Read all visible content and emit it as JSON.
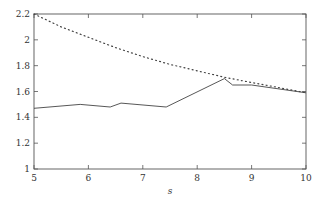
{
  "chart_data": {
    "type": "line",
    "title": "",
    "xlabel": "s",
    "ylabel": "",
    "xlim": [
      5,
      10
    ],
    "ylim": [
      1,
      2.2
    ],
    "grid": false,
    "legend": null,
    "x_ticks": [
      "5",
      "6",
      "7",
      "8",
      "9",
      "10"
    ],
    "y_ticks": [
      "1",
      "1.2",
      "1.4",
      "1.6",
      "1.8",
      "2",
      "2.2"
    ],
    "series": [
      {
        "name": "solid",
        "style": "solid",
        "x": [
          5,
          5.85,
          6.4,
          6.6,
          7.43,
          8.5,
          8.65,
          9.0,
          10
        ],
        "y": [
          1.47,
          1.5,
          1.48,
          1.51,
          1.48,
          1.7,
          1.65,
          1.65,
          1.59
        ]
      },
      {
        "name": "dotted",
        "style": "dotted",
        "x": [
          5,
          5.5,
          6,
          6.5,
          7,
          7.5,
          8,
          8.5,
          9,
          9.5,
          10
        ],
        "y": [
          2.2,
          2.1,
          2.02,
          1.94,
          1.87,
          1.81,
          1.76,
          1.71,
          1.67,
          1.63,
          1.59
        ]
      }
    ]
  },
  "plot": {
    "left": 34,
    "top": 14,
    "right": 306,
    "bottom": 169
  }
}
